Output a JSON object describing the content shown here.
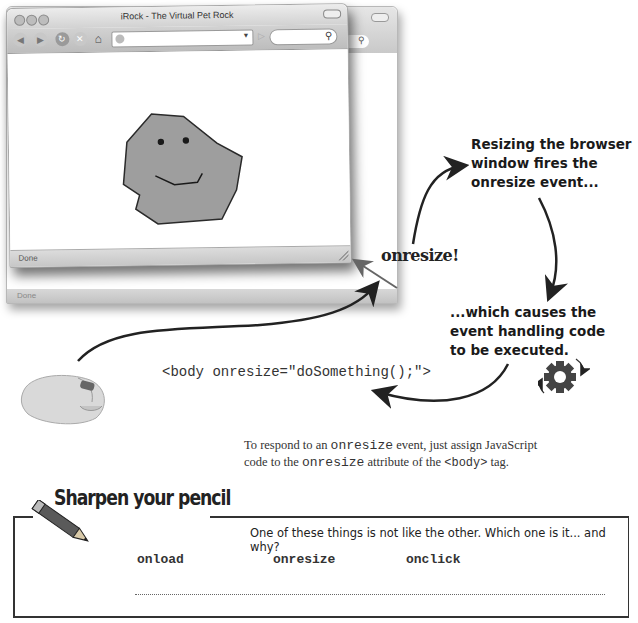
{
  "browser": {
    "window_title": "iRock - The Virtual Pet Rock",
    "status_text": "Done",
    "back_window_status_text": "Done",
    "toolbar_icons": [
      "back-icon",
      "forward-icon",
      "reload-icon",
      "stop-icon",
      "home-icon"
    ],
    "url_value": "",
    "search_value": ""
  },
  "annotations": {
    "resize_note": [
      "Resizing the browser",
      "window fires the",
      "onresize event..."
    ],
    "onresize_label": "onresize!",
    "handler_note": [
      "...which causes the",
      "event handling code",
      "to be executed."
    ],
    "code_snippet": "<body onresize=\"doSomething();\">"
  },
  "caption": {
    "line1_pre": "To respond to an ",
    "line1_code": "onresize",
    "line1_post": " event, just assign JavaScript",
    "line2_pre": "code to the ",
    "line2_code": "onresize",
    "line2_mid": " attribute of the ",
    "line2_code2": "<body>",
    "line2_post": " tag."
  },
  "sharpen": {
    "title": "Sharpen your pencil",
    "question": "One of these things is not like the other. Which one is it... and why?",
    "terms": [
      "onload",
      "onresize",
      "onclick"
    ],
    "answer": ""
  }
}
